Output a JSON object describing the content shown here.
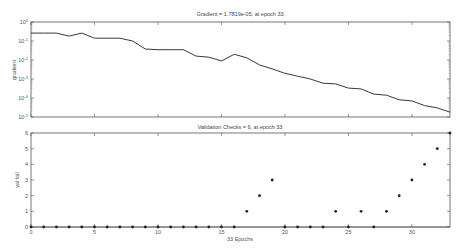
{
  "chart_data": [
    {
      "type": "line",
      "title": "Gradient = 1.7819e-05, at epoch 33",
      "xlabel": "",
      "ylabel": "gradient",
      "yscale": "log",
      "ylim": [
        1e-05,
        1
      ],
      "xlim": [
        0,
        33
      ],
      "yticks": [
        "10^0",
        "10^-1",
        "10^-2",
        "10^-3",
        "10^-4",
        "10^-5"
      ],
      "grid": false,
      "x": [
        0,
        1,
        2,
        3,
        4,
        5,
        6,
        7,
        8,
        9,
        10,
        11,
        12,
        13,
        14,
        15,
        16,
        17,
        18,
        19,
        20,
        21,
        22,
        23,
        24,
        25,
        26,
        27,
        28,
        29,
        30,
        31,
        32,
        33
      ],
      "series": [
        {
          "name": "gradient",
          "values": [
            0.26,
            0.26,
            0.26,
            0.18,
            0.26,
            0.14,
            0.14,
            0.14,
            0.1,
            0.038,
            0.035,
            0.035,
            0.035,
            0.016,
            0.014,
            0.009,
            0.02,
            0.013,
            0.0055,
            0.0034,
            0.002,
            0.0014,
            0.001,
            0.0006,
            0.00055,
            0.00033,
            0.0003,
            0.00016,
            0.00014,
            8e-05,
            7e-05,
            4e-05,
            3e-05,
            1.78e-05
          ]
        }
      ]
    },
    {
      "type": "scatter",
      "title": "Validation Checks = 6, at epoch 33",
      "xlabel": "33 Epochs",
      "ylabel": "val fail",
      "ylim": [
        0,
        6
      ],
      "xlim": [
        0,
        33
      ],
      "xticks": [
        0,
        5,
        10,
        15,
        20,
        25,
        30
      ],
      "yticks": [
        0,
        1,
        2,
        3,
        4,
        5,
        6
      ],
      "grid": false,
      "x": [
        0,
        1,
        2,
        3,
        4,
        5,
        6,
        7,
        8,
        9,
        10,
        11,
        12,
        13,
        14,
        15,
        16,
        17,
        18,
        19,
        20,
        21,
        22,
        23,
        24,
        25,
        26,
        27,
        28,
        29,
        30,
        31,
        32,
        33
      ],
      "series": [
        {
          "name": "val fail",
          "values": [
            0,
            0,
            0,
            0,
            0,
            0,
            0,
            0,
            0,
            0,
            0,
            0,
            0,
            0,
            0,
            0,
            0,
            1,
            2,
            3,
            0,
            0,
            0,
            0,
            1,
            0,
            1,
            0,
            1,
            2,
            3,
            4,
            5,
            6
          ]
        }
      ]
    }
  ],
  "labels": {
    "top_title": "Gradient = 1.7819e-05, at epoch 33",
    "top_ylabel": "gradient",
    "bottom_title": "Validation Checks = 6, at epoch 33",
    "bottom_ylabel": "val fail",
    "bottom_xlabel": "33 Epochs"
  }
}
